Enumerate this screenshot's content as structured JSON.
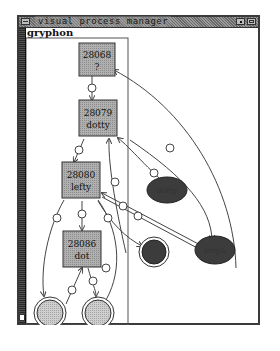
{
  "window": {
    "title": "visual process manager",
    "buttons": {
      "menu": "window-menu",
      "minimize": "minimize",
      "maximize": "maximize"
    }
  },
  "host": {
    "name": "gryphon"
  },
  "processes": [
    {
      "pid": "28068",
      "name": "?"
    },
    {
      "pid": "28079",
      "name": "dotty"
    },
    {
      "pid": "28080",
      "name": "lefty"
    },
    {
      "pid": "28086",
      "name": "dot"
    }
  ],
  "external_nodes": [
    {
      "label": "dotty",
      "shape": "ellipse"
    },
    {
      "label": "steph",
      "shape": "ellipse"
    },
    {
      "label": "ex.\nproc",
      "shape": "double-circle"
    }
  ],
  "file_nodes": [
    {
      "label": "",
      "shape": "double-circle"
    },
    {
      "label": "",
      "shape": "double-circle"
    }
  ],
  "colors": {
    "process_box": "#a8a8a8",
    "ellipse_fill": "#3c3c3c",
    "file_circle_fill": "#c0c0c0",
    "edge": "#444444",
    "title_bar": "#808080"
  }
}
